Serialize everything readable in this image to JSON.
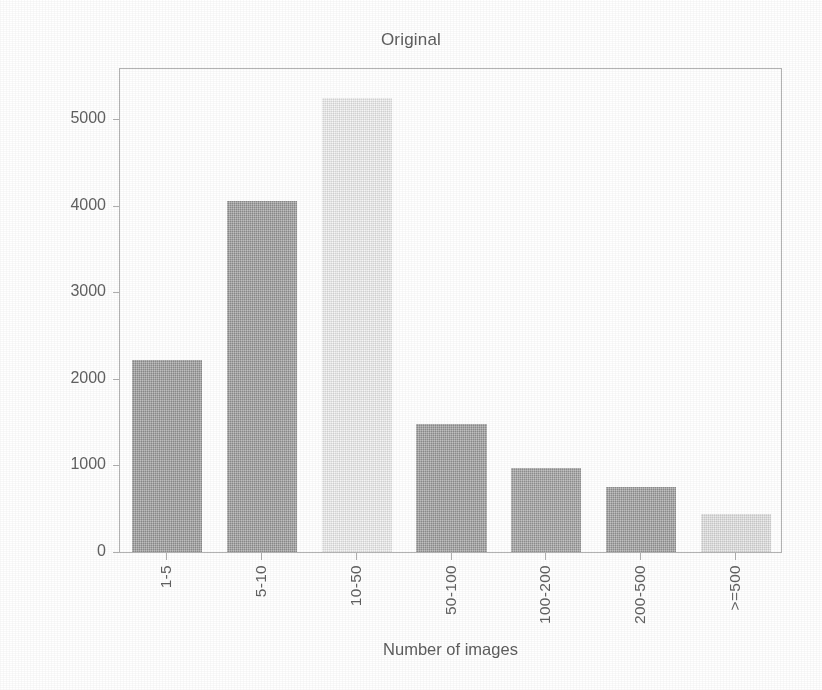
{
  "chart_data": {
    "type": "bar",
    "title": "Original",
    "xlabel": "Number of images",
    "ylabel": "Number of classes",
    "categories": [
      "1-5",
      "5-10",
      "10-50",
      "50-100",
      "100-200",
      "200-500",
      ">=500"
    ],
    "values": [
      2220,
      4050,
      5240,
      1480,
      970,
      750,
      440
    ],
    "bar_colors": [
      "#9b9b9b",
      "#9b9b9b",
      "#f0f0f0",
      "#9d9d9d",
      "#a0a0a0",
      "#9e9e9e",
      "#e2e2e2"
    ],
    "ylim": [
      0,
      5600
    ],
    "yticks": [
      0,
      1000,
      2000,
      3000,
      4000,
      5000
    ],
    "ytick_labels": [
      "0",
      "1000",
      "2000",
      "3000",
      "4000",
      "5000"
    ],
    "grid": false,
    "legend": null,
    "axes_color": "#b3b3b3",
    "text_color": "#5e5e5e",
    "background": "#ffffff"
  }
}
